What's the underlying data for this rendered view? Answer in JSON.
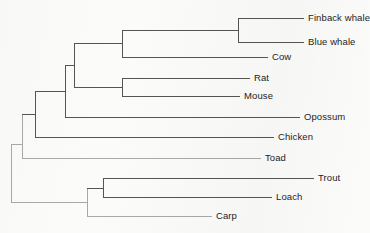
{
  "figure": {
    "type": "phylogenetic-tree",
    "orientation": "left-to-right-rectangular-cladogram",
    "background_color": "#fbfbfa",
    "line_color_dark": "#555555",
    "line_color_light": "#a8a8a8",
    "text_color": "#1d1d1d"
  },
  "leaves": [
    {
      "id": "finback-whale",
      "label": "Finback whale",
      "y": 18,
      "tip_x": 304,
      "label_x": 308
    },
    {
      "id": "blue-whale",
      "label": "Blue whale",
      "y": 42,
      "tip_x": 304,
      "label_x": 308
    },
    {
      "id": "cow",
      "label": "Cow",
      "y": 57,
      "tip_x": 268,
      "label_x": 272
    },
    {
      "id": "rat",
      "label": "Rat",
      "y": 78,
      "tip_x": 250,
      "label_x": 254
    },
    {
      "id": "mouse",
      "label": "Mouse",
      "y": 96,
      "tip_x": 240,
      "label_x": 244
    },
    {
      "id": "opossum",
      "label": "Opossum",
      "y": 117,
      "tip_x": 300,
      "label_x": 304
    },
    {
      "id": "chicken",
      "label": "Chicken",
      "y": 137,
      "tip_x": 274,
      "label_x": 278
    },
    {
      "id": "toad",
      "label": "Toad",
      "y": 158,
      "tip_x": 261,
      "label_x": 265
    },
    {
      "id": "trout",
      "label": "Trout",
      "y": 178,
      "tip_x": 314,
      "label_x": 318
    },
    {
      "id": "loach",
      "label": "Loach",
      "y": 197,
      "tip_x": 272,
      "label_x": 276
    },
    {
      "id": "carp",
      "label": "Carp",
      "y": 216,
      "tip_x": 212,
      "label_x": 216
    }
  ],
  "nodes": [
    {
      "id": "node-whales",
      "x": 238,
      "y_top": 18,
      "y_bottom": 42,
      "parent_x": 122,
      "y": 30,
      "shade": "dark"
    },
    {
      "id": "node-cetartiodactyl",
      "x": 122,
      "y_top": 30,
      "y_bottom": 57,
      "parent_x": 74,
      "y": 43,
      "shade": "dark"
    },
    {
      "id": "node-rodents",
      "x": 122,
      "y_top": 78,
      "y_bottom": 96,
      "parent_x": 74,
      "y": 87,
      "shade": "dark"
    },
    {
      "id": "node-placental",
      "x": 74,
      "y_top": 43,
      "y_bottom": 87,
      "parent_x": 65,
      "y": 65,
      "shade": "dark"
    },
    {
      "id": "node-mammal",
      "x": 65,
      "y_top": 65,
      "y_bottom": 117,
      "parent_x": 35,
      "y": 91,
      "shade": "dark"
    },
    {
      "id": "node-amniote",
      "x": 35,
      "y_top": 91,
      "y_bottom": 137,
      "parent_x": 22,
      "y": 114,
      "shade": "dark"
    },
    {
      "id": "node-tetrapod",
      "x": 22,
      "y_top": 114,
      "y_bottom": 158,
      "parent_x": 11,
      "y": 144,
      "shade": "light"
    },
    {
      "id": "node-trout-loach",
      "x": 103,
      "y_top": 178,
      "y_bottom": 197,
      "parent_x": 87,
      "y": 188,
      "shade": "dark"
    },
    {
      "id": "node-fish",
      "x": 87,
      "y_top": 188,
      "y_bottom": 216,
      "parent_x": 11,
      "y": 202,
      "shade": "light"
    },
    {
      "id": "node-root",
      "x": 11,
      "y_top": 144,
      "y_bottom": 202,
      "parent_x": 11,
      "y": 173,
      "shade": "light"
    }
  ],
  "edges": [
    {
      "id": "edge-finback-whale",
      "x1": 238,
      "x2": 304,
      "y": 18,
      "shade": "dark"
    },
    {
      "id": "edge-blue-whale",
      "x1": 238,
      "x2": 304,
      "y": 42,
      "shade": "dark"
    },
    {
      "id": "edge-cow",
      "x1": 122,
      "x2": 268,
      "y": 57,
      "shade": "dark"
    },
    {
      "id": "edge-rat",
      "x1": 122,
      "x2": 250,
      "y": 78,
      "shade": "dark"
    },
    {
      "id": "edge-mouse",
      "x1": 122,
      "x2": 240,
      "y": 96,
      "shade": "dark"
    },
    {
      "id": "edge-opossum",
      "x1": 65,
      "x2": 300,
      "y": 117,
      "shade": "dark"
    },
    {
      "id": "edge-chicken",
      "x1": 35,
      "x2": 274,
      "y": 137,
      "shade": "dark"
    },
    {
      "id": "edge-toad",
      "x1": 22,
      "x2": 261,
      "y": 158,
      "shade": "light"
    },
    {
      "id": "edge-trout",
      "x1": 103,
      "x2": 314,
      "y": 178,
      "shade": "dark"
    },
    {
      "id": "edge-loach",
      "x1": 103,
      "x2": 272,
      "y": 197,
      "shade": "dark"
    },
    {
      "id": "edge-carp",
      "x1": 87,
      "x2": 212,
      "y": 216,
      "shade": "light"
    },
    {
      "id": "edge-whales-stem",
      "x1": 122,
      "x2": 238,
      "y": 30,
      "shade": "dark"
    },
    {
      "id": "edge-cetartiodactyl-stem",
      "x1": 74,
      "x2": 122,
      "y": 43,
      "shade": "dark"
    },
    {
      "id": "edge-rodents-stem",
      "x1": 74,
      "x2": 122,
      "y": 87,
      "shade": "dark"
    },
    {
      "id": "edge-placental-stem",
      "x1": 65,
      "x2": 74,
      "y": 65,
      "shade": "dark"
    },
    {
      "id": "edge-mammal-stem",
      "x1": 35,
      "x2": 65,
      "y": 91,
      "shade": "dark"
    },
    {
      "id": "edge-amniote-stem",
      "x1": 22,
      "x2": 35,
      "y": 114,
      "shade": "dark"
    },
    {
      "id": "edge-tetrapod-stem",
      "x1": 11,
      "x2": 22,
      "y": 144,
      "shade": "light"
    },
    {
      "id": "edge-trout-loach-stem",
      "x1": 87,
      "x2": 103,
      "y": 188,
      "shade": "dark"
    },
    {
      "id": "edge-fish-stem",
      "x1": 11,
      "x2": 87,
      "y": 202,
      "shade": "light"
    }
  ]
}
